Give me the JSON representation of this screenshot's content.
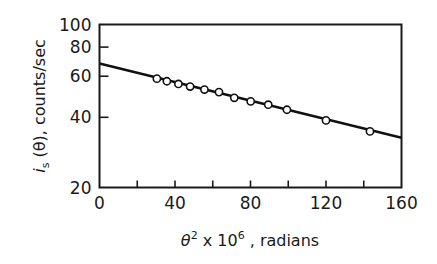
{
  "chart_data": {
    "type": "scatter",
    "title": "",
    "xlabel": "θ² x 10⁶ , radians",
    "ylabel": "i_s (θ), counts/sec",
    "xscale": "linear",
    "yscale": "log",
    "xlim": [
      0,
      160
    ],
    "ylim": [
      20,
      100
    ],
    "xticks": [
      0,
      20,
      40,
      60,
      80,
      100,
      120,
      140,
      160
    ],
    "xtick_labels": [
      "0",
      "",
      "40",
      "",
      "80",
      "",
      "120",
      "",
      "160"
    ],
    "yticks": [
      20,
      40,
      60,
      80,
      100
    ],
    "ytick_labels": [
      "20",
      "40",
      "60",
      "80",
      "100"
    ],
    "grid": false,
    "legend": null,
    "series": [
      {
        "name": "measured",
        "marker": "open-circle",
        "x": [
          30.4,
          35.7,
          41.8,
          48.0,
          55.6,
          63.3,
          71.4,
          80.1,
          89.4,
          99.3,
          120.0,
          143.3
        ],
        "y": [
          58.6,
          57.1,
          55.6,
          54.2,
          52.6,
          51.3,
          48.5,
          46.8,
          45.3,
          43.1,
          38.8,
          34.8
        ]
      },
      {
        "name": "fit",
        "style": "line",
        "x": [
          0,
          160
        ],
        "y": [
          68,
          32.7
        ]
      }
    ]
  },
  "labels": {
    "y_axis_main": "i",
    "y_axis_sub": "s",
    "y_axis_rest": " (θ), counts/sec",
    "x_axis_theta": "θ",
    "x_axis_sup1": "2",
    "x_axis_mid": " x 10",
    "x_axis_sup2": "6",
    "x_axis_rest": " , radians"
  }
}
